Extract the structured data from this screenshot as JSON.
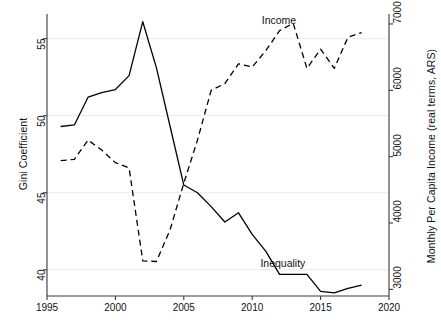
{
  "chart_data": {
    "type": "line",
    "title": "",
    "subtitle": "",
    "xlabel": "",
    "ylabel": "Gini Coefficient",
    "y2label": "Monthly Per Capita Income (real terms, ARS)",
    "xlim": [
      1995,
      2020
    ],
    "ylim": [
      38.3,
      56.6
    ],
    "y2lim": [
      2900,
      7150
    ],
    "xticks": [
      "1995",
      "2000",
      "2005",
      "2010",
      "2015",
      "2020"
    ],
    "xtick_values": [
      1995,
      2000,
      2005,
      2010,
      2015,
      2020
    ],
    "yticks": [
      "40",
      "45",
      "50",
      "55"
    ],
    "ytick_values": [
      40,
      45,
      50,
      55
    ],
    "y2ticks": [
      "3000",
      "4000",
      "5000",
      "6000",
      "7000"
    ],
    "y2tick_values": [
      3000,
      4000,
      5000,
      6000,
      7000
    ],
    "grid": true,
    "grid_axis": "y",
    "legend_position": "inline-annotations",
    "x": [
      1996,
      1997,
      1998,
      1999,
      2000,
      2001,
      2002,
      2003,
      2004,
      2005,
      2006,
      2007,
      2008,
      2009,
      2010,
      2011,
      2012,
      2013,
      2014,
      2015,
      2016,
      2017,
      2018
    ],
    "series": [
      {
        "name": "Inequality",
        "axis": "left",
        "style": "solid",
        "color": "#000000",
        "values": [
          49.3,
          49.4,
          51.2,
          51.5,
          51.7,
          52.6,
          56.1,
          53.1,
          49.3,
          45.5,
          45.0,
          44.1,
          43.1,
          43.7,
          42.3,
          41.2,
          39.7,
          39.7,
          39.7,
          38.6,
          38.5,
          38.8,
          39.0
        ]
      },
      {
        "name": "Income",
        "axis": "right",
        "style": "dashed",
        "color": "#000000",
        "values": [
          4940,
          4960,
          5250,
          5100,
          4910,
          4830,
          3430,
          3420,
          3900,
          4600,
          5250,
          6000,
          6100,
          6400,
          6350,
          6600,
          6900,
          7010,
          6330,
          6620,
          6330,
          6800,
          6870
        ]
      }
    ],
    "annotations": [
      {
        "text": "Income",
        "x": 2010.7,
        "y2": 7050
      },
      {
        "text": "Inequality",
        "x": 2010.6,
        "y": 40.4
      }
    ]
  },
  "plot_geometry": {
    "left_px": 47,
    "right_px": 389,
    "top_px": 14,
    "bottom_px": 296
  }
}
